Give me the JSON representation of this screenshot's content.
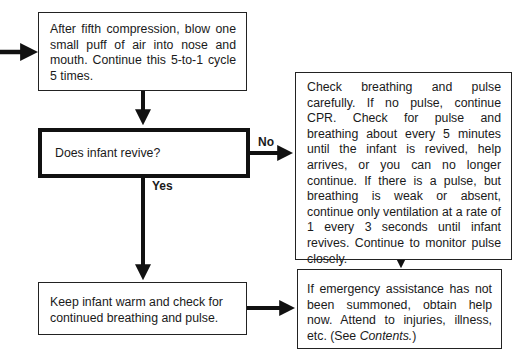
{
  "diagram": {
    "type": "flowchart",
    "nodes": {
      "step_compression": {
        "text": "After fifth compression, blow one small puff of air into nose and mouth. Continue this 5-to-1 cycle 5 times."
      },
      "decision_revive": {
        "text": "Does infant revive?"
      },
      "step_check_breathing": {
        "text": "Check breathing and pulse carefully. If no pulse, continue CPR. Check for pulse and breathing about every 5 minutes until the infant is revived, help arrives, or you can no longer continue. If there is a pulse, but breathing is weak or absent, continue only ventilation at a rate of 1 every 3 seconds until infant revives. Continue to monitor pulse closely."
      },
      "step_keep_warm": {
        "text": "Keep infant warm and check for continued breathing and pulse."
      },
      "step_get_help": {
        "text_main": "If emergency assistance has not been summoned, obtain help now. Attend to injuries, illness, etc. (See ",
        "text_italic": "Contents.",
        "text_end": ")"
      }
    },
    "edges": [
      {
        "from": "incoming",
        "to": "step_compression",
        "label": ""
      },
      {
        "from": "step_compression",
        "to": "decision_revive",
        "label": ""
      },
      {
        "from": "decision_revive",
        "to": "step_check_breathing",
        "label": "No"
      },
      {
        "from": "decision_revive",
        "to": "step_keep_warm",
        "label": "Yes"
      },
      {
        "from": "step_keep_warm",
        "to": "step_get_help",
        "label": ""
      },
      {
        "from": "step_check_breathing",
        "to": "step_get_help",
        "label": ""
      }
    ],
    "labels": {
      "no": "No",
      "yes": "Yes"
    }
  }
}
